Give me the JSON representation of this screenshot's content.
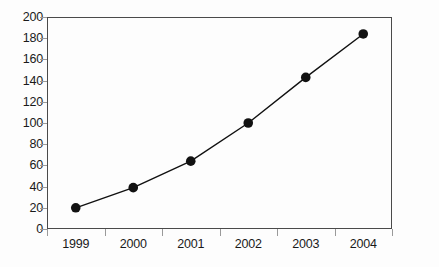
{
  "chart_data": {
    "type": "line",
    "title": "",
    "subtitle": "",
    "xlabel": "",
    "ylabel": "",
    "categories": [
      "1999",
      "2000",
      "2001",
      "2002",
      "2003",
      "2004"
    ],
    "values": [
      20,
      39,
      64,
      100,
      143,
      184
    ],
    "series": [
      {
        "name": "",
        "values": [
          20,
          39,
          64,
          100,
          143,
          184
        ]
      }
    ],
    "ylim": [
      0,
      200
    ],
    "yticks": [
      0,
      20,
      40,
      60,
      80,
      100,
      120,
      140,
      160,
      180,
      200
    ],
    "ytick_labels": [
      "0",
      "20",
      "40",
      "60",
      "80",
      "100",
      "120",
      "140",
      "160",
      "180",
      "200"
    ],
    "xtick_labels": [
      "1999",
      "2000",
      "2001",
      "2002",
      "2003",
      "2004"
    ],
    "grid": false,
    "legend": false,
    "legend_position": "none",
    "marker": "circle-filled",
    "marker_color": "#111111",
    "line_color": "#111111",
    "axis_color": "#4a4a4a",
    "tick_color": "#9a9a9a",
    "background_color": "#fdfdfd",
    "annotations": []
  }
}
